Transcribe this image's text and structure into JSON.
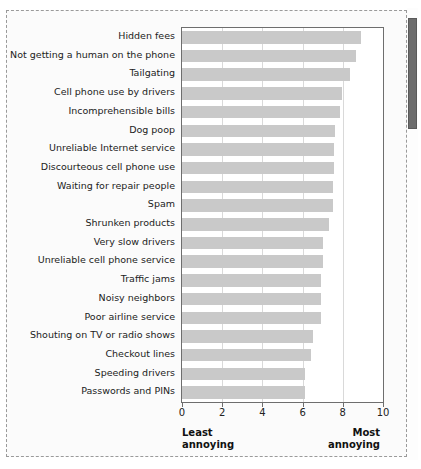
{
  "chart_data": {
    "type": "bar",
    "orientation": "horizontal",
    "title": "",
    "subtitle": "",
    "xlabel": "",
    "ylabel": "",
    "xlim": [
      0,
      10
    ],
    "ylim": null,
    "grid": "vertical",
    "legend": null,
    "legend_position": "none",
    "xticks": [
      0,
      2,
      4,
      6,
      8,
      10
    ],
    "xtick_labels": [
      "0",
      "2",
      "4",
      "6",
      "8",
      "10"
    ],
    "bar_color": "#c9c9c9",
    "frame_color": "#6e6e6e",
    "gridline_color": "#d9d9d9",
    "categories": [
      "Hidden fees",
      "Not getting a human on the phone",
      "Tailgating",
      "Cell phone use by drivers",
      "Incomprehensible bills",
      "Dog poop",
      "Unreliable Internet service",
      "Discourteous cell phone use",
      "Waiting for repair people",
      "Spam",
      "Shrunken products",
      "Very slow drivers",
      "Unreliable cell phone service",
      "Traffic jams",
      "Noisy neighbors",
      "Poor airline service",
      "Shouting on TV or radio shows",
      "Checkout lines",
      "Speeding drivers",
      "Passwords and PINs"
    ],
    "values": [
      8.9,
      8.65,
      8.35,
      7.95,
      7.85,
      7.6,
      7.55,
      7.55,
      7.5,
      7.5,
      7.3,
      7.0,
      7.0,
      6.9,
      6.9,
      6.9,
      6.5,
      6.4,
      6.1,
      6.1
    ],
    "annotations": {
      "left_endpoint": "Least\nannoying",
      "right_endpoint": "Most\nannoying"
    }
  },
  "axis": {
    "least_line1": "Least",
    "least_line2": "annoying",
    "most_line1": "Most",
    "most_line2": "annoying"
  },
  "scrollbar": {
    "name": "vertical-scrollbar"
  }
}
